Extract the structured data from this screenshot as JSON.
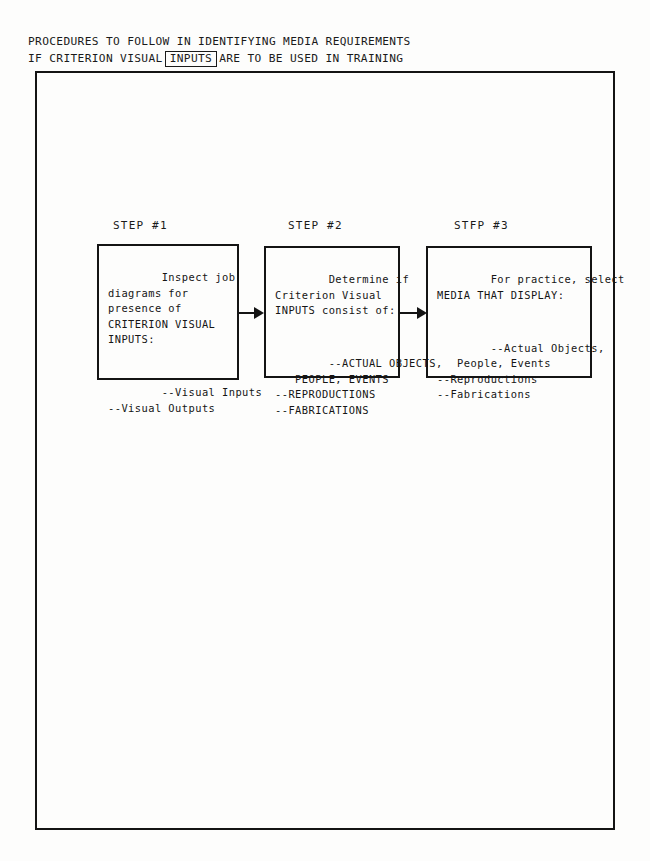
{
  "document": {
    "title_line_1": "PROCEDURES TO FOLLOW IN IDENTIFYING MEDIA REQUIREMENTS",
    "title_line_2_before": "IF CRITERION VISUAL",
    "title_line_2_boxed": "INPUTS",
    "title_line_2_after": "ARE TO BE USED IN TRAINING"
  },
  "flow": {
    "steps": [
      {
        "label": "STEP #1",
        "body_top": "Inspect job\ndiagrams for\npresence of\nCRITERION VISUAL\nINPUTS:",
        "body_bottom": "--Visual Inputs\n--Visual Outputs"
      },
      {
        "label": "STEP #2",
        "body_top": "Determine if\nCriterion Visual\nINPUTS consist of:",
        "body_bottom": "--ACTUAL OBJECTS,\n   PEOPLE, EVENTS\n--REPRODUCTIONS\n--FABRICATIONS"
      },
      {
        "label": "STFP #3",
        "body_top": "For practice, select\nMEDIA THAT DISPLAY:",
        "body_bottom": "--Actual Objects,\n   People, Events\n--Reproductions\n--Fabrications"
      }
    ],
    "connectors": [
      {
        "name": "arrow-step1-to-step2"
      },
      {
        "name": "arrow-step2-to-step3"
      }
    ]
  },
  "colors": {
    "ink": "#141414",
    "paper": "#fdfdfc"
  }
}
